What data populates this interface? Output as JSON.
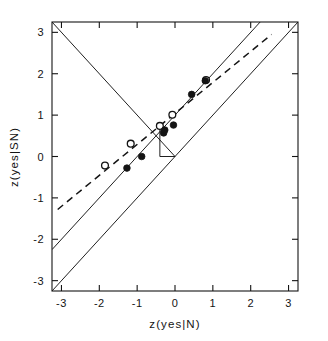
{
  "chart_data": {
    "type": "scatter",
    "title": "",
    "xlabel": "z(yes|N)",
    "ylabel": "z(yes|SN)",
    "xlim": [
      -3.25,
      3.25
    ],
    "ylim": [
      -3.25,
      3.25
    ],
    "grid": false,
    "legend_position": "none",
    "xticks": [
      -3,
      -2,
      -1,
      0,
      1,
      2,
      3
    ],
    "yticks": [
      -3,
      -2,
      -1,
      0,
      1,
      2,
      3
    ],
    "xtick_labels": [
      "-3",
      "-2",
      "-1",
      "0",
      "1",
      "2",
      "3"
    ],
    "ytick_labels": [
      "-3",
      "-2",
      "-1",
      "0",
      "1",
      "2",
      "3"
    ],
    "series": [
      {
        "name": "open-circles",
        "marker": "open circle",
        "points": [
          {
            "x": -1.85,
            "y": -0.22
          },
          {
            "x": -1.17,
            "y": 0.31
          },
          {
            "x": -0.4,
            "y": 0.74
          },
          {
            "x": -0.07,
            "y": 1.01
          },
          {
            "x": 0.82,
            "y": 1.85
          }
        ]
      },
      {
        "name": "filled-circles",
        "marker": "filled circle",
        "points": [
          {
            "x": -1.27,
            "y": -0.28
          },
          {
            "x": -0.88,
            "y": 0.0
          },
          {
            "x": -0.3,
            "y": 0.57
          },
          {
            "x": -0.27,
            "y": 0.64
          },
          {
            "x": -0.04,
            "y": 0.76
          },
          {
            "x": 0.44,
            "y": 1.5
          },
          {
            "x": 0.8,
            "y": 1.83
          }
        ]
      }
    ],
    "annotations": [
      {
        "name": "identity-line",
        "type": "line",
        "from": {
          "x": -3.25,
          "y": -3.25
        },
        "to": {
          "x": 3.25,
          "y": 3.25
        },
        "style": "solid"
      },
      {
        "name": "offset-parallel-line",
        "type": "line",
        "from": {
          "x": -3.25,
          "y": -2.25
        },
        "to": {
          "x": 2.25,
          "y": 3.25
        },
        "style": "solid"
      },
      {
        "name": "anti-diagonal-line",
        "type": "line",
        "from": {
          "x": -3.25,
          "y": 3.25
        },
        "to": {
          "x": 0.0,
          "y": 0.0
        },
        "style": "solid"
      },
      {
        "name": "vertical-segment",
        "type": "line",
        "from": {
          "x": -0.4,
          "y": 0.0
        },
        "to": {
          "x": -0.4,
          "y": 0.78
        },
        "style": "solid"
      },
      {
        "name": "horizontal-segment",
        "type": "line",
        "from": {
          "x": -0.4,
          "y": 0.0
        },
        "to": {
          "x": 0.0,
          "y": 0.0
        },
        "style": "solid"
      },
      {
        "name": "dashed-fit-line",
        "type": "line",
        "from": {
          "x": -3.1,
          "y": -1.28
        },
        "to": {
          "x": 2.55,
          "y": 2.95
        },
        "style": "dashed"
      }
    ]
  },
  "figure": {
    "background_color": "#ffffff",
    "ink_color": "#141414"
  }
}
